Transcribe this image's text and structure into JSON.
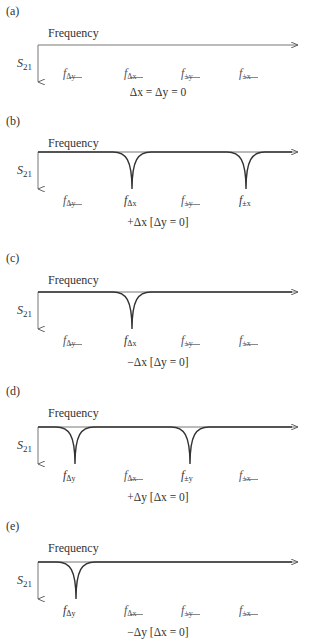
{
  "figure": {
    "axis_label": "Frequency",
    "y_axis_label": "S",
    "y_axis_sub": "21",
    "frequency_markers": [
      {
        "id": "f_dy",
        "base": "f",
        "sub": "Δy",
        "x": 72
      },
      {
        "id": "f_dx",
        "base": "f",
        "sub": "Δx",
        "x": 133
      },
      {
        "id": "f_pmy",
        "base": "f",
        "sub": "±y",
        "x": 190
      },
      {
        "id": "f_pmx",
        "base": "f",
        "sub": "±x",
        "x": 248
      }
    ],
    "panels": [
      {
        "label": "(a)",
        "caption": "Δx = Δy = 0",
        "top": 0,
        "active": [],
        "dips": []
      },
      {
        "label": "(b)",
        "caption": "+Δx [Δy = 0]",
        "top": 110,
        "active": [
          "f_dx",
          "f_pmx"
        ],
        "dips": [
          132,
          246
        ]
      },
      {
        "label": "(c)",
        "caption": "−Δx [Δy = 0]",
        "top": 247,
        "active": [
          "f_dx"
        ],
        "dips": [
          132
        ]
      },
      {
        "label": "(d)",
        "caption": "+Δy [Δx = 0]",
        "top": 380,
        "active": [
          "f_dy",
          "f_pmy"
        ],
        "dips": [
          75,
          190
        ]
      },
      {
        "label": "(e)",
        "caption": "−Δy [Δx = 0]",
        "top": 515,
        "active": [
          "f_dy"
        ],
        "dips": [
          76
        ]
      }
    ]
  }
}
